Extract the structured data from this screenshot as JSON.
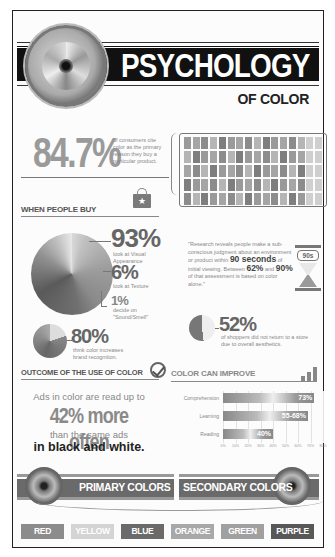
{
  "header": {
    "title": "PSYCHOLOGY",
    "subtitle": "OF COLOR"
  },
  "stat_primary": {
    "value": "84.7%",
    "description": "of consumers cite color as the primary reason they buy a particular product."
  },
  "when_people_buy": {
    "heading": "WHEN PEOPLE BUY",
    "items": [
      {
        "value": "93%",
        "description": "look at Visual Appearance"
      },
      {
        "value": "6%",
        "description": "look at Texture"
      },
      {
        "value": "1%",
        "description": "decide on \"Sound/Smell\""
      }
    ],
    "brand": {
      "value": "80%",
      "description": "think color increases brand recognition."
    }
  },
  "quote": {
    "part1": "\"Research reveals people make a sub-conscious judgment about an environment or product within",
    "highlight1": "90 seconds",
    "part2": "of initial viewing. Between",
    "highlight2": "62%",
    "part3": "and",
    "highlight3": "90%",
    "part4": "of that assessment is based on color alone.\"",
    "hourglass_label": "90s"
  },
  "shoppers": {
    "value": "52%",
    "description": "of shoppers did not return to a store due to overall aesthetics."
  },
  "outcome": {
    "heading": "OUTCOME OF THE USE OF COLOR",
    "line1": "Ads in color are read up to",
    "line2": "42% more often",
    "line3": "than the same ads",
    "line4": "in black and white."
  },
  "chart_data": {
    "type": "bar",
    "title": "COLOR CAN IMPROVE",
    "orientation": "horizontal",
    "categories": [
      "Comprehension",
      "Learning",
      "Reading"
    ],
    "values": [
      73,
      68,
      40
    ],
    "value_labels": [
      "73%",
      "55-68%",
      "40%"
    ],
    "xticks": [
      "0%",
      "10%",
      "20%",
      "30%",
      "40%",
      "50%",
      "60%",
      "70%",
      "80%"
    ],
    "xlim": [
      0,
      80
    ],
    "grid": true
  },
  "colors_section": {
    "primary_label": "PRIMARY COLORS",
    "secondary_label": "SECONDARY COLORS",
    "chips": [
      {
        "label": "RED",
        "bg": "#8c8c8c"
      },
      {
        "label": "YELLOW",
        "bg": "#d4d4d4"
      },
      {
        "label": "BLUE",
        "bg": "#6a6a6a"
      },
      {
        "label": "ORANGE",
        "bg": "#a8a8a8"
      },
      {
        "label": "GREEN",
        "bg": "#a0a0a0"
      },
      {
        "label": "PURPLE",
        "bg": "#585858"
      }
    ]
  },
  "people_grid": {
    "shades": [
      "#9a9a9a",
      "#a5a5a5",
      "#8c8c8c",
      "#b5b5b5",
      "#7e7e7e"
    ]
  }
}
